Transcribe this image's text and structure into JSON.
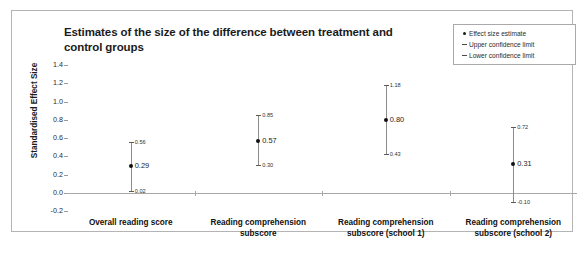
{
  "chart_data": {
    "type": "scatter",
    "title": "Estimates of the size of the difference between treatment and control groups",
    "xlabel": "",
    "ylabel": "Standardised Effect Size",
    "ylim": [
      -0.2,
      1.4
    ],
    "yticks": [
      "1.4",
      "1.2",
      "1.0",
      "0.8",
      "0.6",
      "0.4",
      "0.2",
      "0.0",
      "-0.2"
    ],
    "grid": false,
    "legend_position": "top-right",
    "categories": [
      "Overall reading score",
      "Reading comprehension subscore",
      "Reading comprehension subscore (school 1)",
      "Reading comprehension subscore (school 2)"
    ],
    "series": [
      {
        "name": "Effect size estimate",
        "values": [
          0.29,
          0.57,
          0.8,
          0.31
        ]
      },
      {
        "name": "Upper confidence limit",
        "values": [
          0.56,
          0.85,
          1.18,
          0.72
        ]
      },
      {
        "name": "Lower confidence limit",
        "values": [
          0.02,
          0.3,
          0.43,
          -0.1
        ]
      }
    ],
    "point_labels": {
      "estimate": [
        "0.29",
        "0.57",
        "0.80",
        "0.31"
      ],
      "upper": [
        "0.56",
        "0.85",
        "1.18",
        "0.72"
      ],
      "lower": [
        "0.02",
        "0.30",
        "0.43",
        "-0.10"
      ]
    }
  },
  "legend": {
    "items": [
      {
        "marker": "dot",
        "label": "Effect size estimate"
      },
      {
        "marker": "dash",
        "label": "Upper confidence limit"
      },
      {
        "marker": "dash",
        "label": "Lower confidence limit"
      }
    ]
  },
  "axis": {
    "y_title": "Standardised Effect Size",
    "y_ticks": [
      "1.4",
      "1.2",
      "1.0",
      "0.8",
      "0.6",
      "0.4",
      "0.2",
      "0.0",
      "-0.2"
    ]
  },
  "x_labels": {
    "cat0_line1": "Overall reading score",
    "cat0_line2": "",
    "cat1_line1": "Reading comprehension",
    "cat1_line2": "subscore",
    "cat2_line1": "Reading comprehension",
    "cat2_line2": "subscore (school 1)",
    "cat3_line1": "Reading comprehension",
    "cat3_line2": "subscore (school 2)"
  },
  "colors": {
    "frame": "#b4b4b4",
    "axis": "#a8a8a8",
    "point": "#111111",
    "line": "#8c8c8c",
    "text": "#1b1b1b"
  }
}
